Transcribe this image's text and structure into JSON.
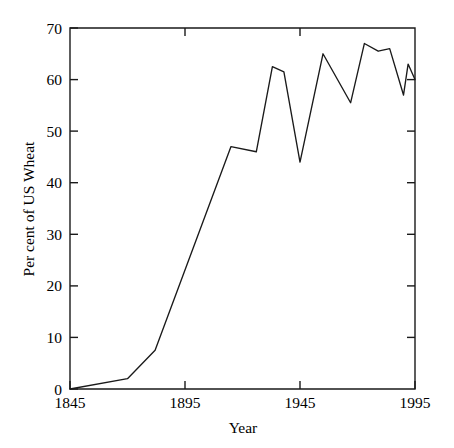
{
  "chart_data": {
    "type": "line",
    "title": "",
    "xlabel": "Year",
    "ylabel": "Per cent of US Wheat",
    "xlim": [
      1845,
      1995
    ],
    "ylim": [
      0,
      70
    ],
    "xticks": [
      1845,
      1895,
      1945,
      1995
    ],
    "xticklabels": [
      "1845",
      "1895",
      "1945",
      "1995"
    ],
    "yticks": [
      0,
      10,
      20,
      30,
      40,
      50,
      60,
      70
    ],
    "yticklabels": [
      "0",
      "10",
      "20",
      "30",
      "40",
      "50",
      "60",
      "70"
    ],
    "grid": false,
    "legend": false,
    "legend_position": "none",
    "line_color": "#1a1a1a",
    "series": [
      {
        "name": "Per cent of US Wheat",
        "x": [
          1845,
          1870,
          1882,
          1915,
          1926,
          1933,
          1938,
          1945,
          1955,
          1967,
          1973,
          1979,
          1984,
          1990,
          1992,
          1995
        ],
        "values": [
          0,
          2,
          7.5,
          47,
          46,
          62.5,
          61.5,
          44,
          65,
          55.5,
          67,
          65.5,
          66,
          57,
          63,
          60
        ]
      }
    ],
    "points": [
      {
        "x": 1845,
        "y": 0
      },
      {
        "x": 1870,
        "y": 2
      },
      {
        "x": 1882,
        "y": 7.5
      },
      {
        "x": 1915,
        "y": 47
      },
      {
        "x": 1926,
        "y": 46
      },
      {
        "x": 1933,
        "y": 62.5
      },
      {
        "x": 1938,
        "y": 61.5
      },
      {
        "x": 1945,
        "y": 44
      },
      {
        "x": 1955,
        "y": 65
      },
      {
        "x": 1967,
        "y": 55.5
      },
      {
        "x": 1973,
        "y": 67
      },
      {
        "x": 1979,
        "y": 65.5
      },
      {
        "x": 1984,
        "y": 66
      },
      {
        "x": 1990,
        "y": 57
      },
      {
        "x": 1992,
        "y": 63
      },
      {
        "x": 1995,
        "y": 60
      }
    ]
  },
  "axes": {
    "x_title": "Year",
    "y_title": "Per cent of US Wheat",
    "x_tick_labels": [
      "1845",
      "1895",
      "1945",
      "1995"
    ],
    "y_tick_labels": [
      "0",
      "10",
      "20",
      "30",
      "40",
      "50",
      "60",
      "70"
    ]
  }
}
